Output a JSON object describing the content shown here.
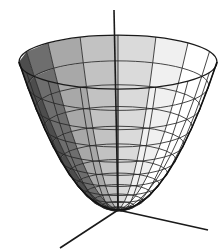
{
  "figure": {
    "title": "",
    "caption": "",
    "background_color": "#ffffff",
    "line_color": "#262626",
    "axis_color": "#1a1a1a"
  },
  "chart_data": {
    "type": "line",
    "title": "",
    "subtitle": "",
    "xlabel": "",
    "ylabel": "",
    "zlabel": "",
    "surface_kind": "paraboloid",
    "equation": "z = x^2 + y^2",
    "render_style": "wireframe-with-shading",
    "legend": [],
    "annotations": [],
    "grid": true,
    "legend_position": "none",
    "xlim": [
      -1,
      1
    ],
    "ylim": [
      -1,
      1
    ],
    "zlim": [
      0,
      1
    ],
    "mesh": {
      "radial_sectors": 16,
      "height_rings": 13,
      "ring_heights": [
        0.0,
        0.0069,
        0.0278,
        0.0625,
        0.1111,
        0.1736,
        0.25,
        0.3403,
        0.4444,
        0.5625,
        0.6944,
        0.8403,
        1.0
      ],
      "sector_angles_deg": [
        0,
        22.5,
        45,
        67.5,
        90,
        112.5,
        135,
        157.5,
        180,
        202.5,
        225,
        247.5,
        270,
        292.5,
        315,
        337.5
      ]
    },
    "projection": {
      "center_x": 118,
      "vertex_y": 210,
      "rim_y": 62,
      "rim_radius_x": 99,
      "rim_radius_y": 27,
      "bowl_depth": 148
    },
    "shading": {
      "palette": [
        "#ffffff",
        "#f0f0f0",
        "#dadada",
        "#c2c2c2",
        "#a8a8a8",
        "#8c8c8c",
        "#6e6e6e",
        "#4d4d4d",
        "#333333"
      ],
      "sector_fill_index": [
        0,
        0,
        0,
        1,
        2,
        3,
        4,
        6,
        7,
        6,
        4,
        3,
        2,
        1,
        0,
        0
      ],
      "lit_direction": "upper-right",
      "shadow_direction": "left"
    },
    "axes": [
      {
        "name": "z-axis",
        "from_px": [
          118,
          210
        ],
        "to_px": [
          114,
          10
        ],
        "visible_segment": "above-rim",
        "tip_px": [
          114,
          10
        ]
      },
      {
        "name": "x-axis",
        "from_px": [
          118,
          210
        ],
        "to_px": [
          60,
          248
        ],
        "tip_px": [
          60,
          248
        ]
      },
      {
        "name": "y-axis",
        "from_px": [
          118,
          210
        ],
        "to_px": [
          208,
          230
        ],
        "tip_px": [
          208,
          230
        ]
      }
    ]
  },
  "canvas": {
    "width": 224,
    "height": 252
  }
}
